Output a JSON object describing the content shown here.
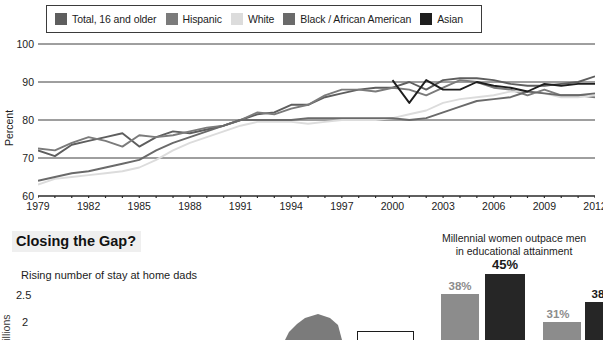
{
  "legend": {
    "items": [
      {
        "label": "Total, 16 and older",
        "color": "#5e5e5e"
      },
      {
        "label": "Hispanic",
        "color": "#7b7b7b"
      },
      {
        "label": "White",
        "color": "#dcdcdc"
      },
      {
        "label": "Black / African American",
        "color": "#6a6a6a"
      },
      {
        "label": "Asian",
        "color": "#1e1e1e"
      }
    ]
  },
  "chart_data": [
    {
      "type": "line",
      "title": "",
      "xlabel": "",
      "ylabel": "Percent",
      "ylim": [
        60,
        100
      ],
      "yticks": [
        60,
        70,
        80,
        90,
        100
      ],
      "xlim": [
        1979,
        2012
      ],
      "xticks_labeled": [
        1979,
        1982,
        1985,
        1988,
        1991,
        1994,
        1997,
        2000,
        2003,
        2006,
        2009,
        2012
      ],
      "grid": true,
      "legend_position": "top",
      "x": [
        1979,
        1980,
        1981,
        1982,
        1983,
        1984,
        1985,
        1986,
        1987,
        1988,
        1989,
        1990,
        1991,
        1992,
        1993,
        1994,
        1995,
        1996,
        1997,
        1998,
        1999,
        2000,
        2001,
        2002,
        2003,
        2004,
        2005,
        2006,
        2007,
        2008,
        2009,
        2010,
        2011,
        2012
      ],
      "series": [
        {
          "name": "Total, 16 and older",
          "color": "#5e5e5e",
          "values": [
            72.0,
            70.5,
            73.5,
            74.5,
            75.5,
            76.5,
            73.0,
            75.5,
            77.0,
            76.5,
            77.5,
            78.5,
            80.0,
            81.5,
            82.0,
            84.0,
            84.0,
            86.0,
            87.0,
            88.0,
            88.5,
            88.5,
            90.0,
            88.0,
            90.5,
            91.0,
            91.0,
            90.5,
            89.5,
            89.0,
            89.0,
            89.5,
            90.0,
            91.5
          ]
        },
        {
          "name": "Hispanic",
          "color": "#7b7b7b",
          "values": [
            72.5,
            72.0,
            74.0,
            75.5,
            74.5,
            73.0,
            76.0,
            75.5,
            76.0,
            77.0,
            78.0,
            78.5,
            80.0,
            82.0,
            81.5,
            83.0,
            84.0,
            86.5,
            88.0,
            88.0,
            87.5,
            88.5,
            88.0,
            86.5,
            88.5,
            90.5,
            90.0,
            88.5,
            88.0,
            86.5,
            88.0,
            86.5,
            86.5,
            86.0
          ]
        },
        {
          "name": "White",
          "color": "#dcdcdc",
          "values": [
            63.0,
            64.5,
            65.0,
            65.5,
            66.0,
            66.5,
            67.5,
            69.5,
            72.0,
            74.0,
            75.5,
            77.0,
            78.5,
            79.5,
            79.5,
            79.5,
            79.0,
            79.5,
            80.0,
            80.0,
            80.0,
            80.5,
            81.5,
            82.5,
            84.5,
            85.5,
            86.0,
            86.5,
            87.5,
            87.5,
            87.0,
            86.0,
            86.0,
            86.5
          ]
        },
        {
          "name": "Black / African American",
          "color": "#6a6a6a",
          "values": [
            64.0,
            65.0,
            66.0,
            66.5,
            67.5,
            68.5,
            69.5,
            72.0,
            74.0,
            75.5,
            77.0,
            78.5,
            80.0,
            80.0,
            80.0,
            80.0,
            80.5,
            80.5,
            80.5,
            80.5,
            80.5,
            80.5,
            80.0,
            80.5,
            82.0,
            83.5,
            85.0,
            85.5,
            86.0,
            87.5,
            87.0,
            86.5,
            86.5,
            87.0
          ]
        },
        {
          "name": "Asian",
          "color": "#1e1e1e",
          "values": [
            null,
            null,
            null,
            null,
            null,
            null,
            null,
            null,
            null,
            null,
            null,
            null,
            null,
            null,
            null,
            null,
            null,
            null,
            null,
            null,
            null,
            90.5,
            84.5,
            90.5,
            88.0,
            88.0,
            90.0,
            89.0,
            88.5,
            87.5,
            89.5,
            89.0,
            89.5,
            89.5
          ]
        }
      ]
    },
    {
      "type": "area",
      "title": "Rising number of stay at home dads",
      "ylabel": "Millions",
      "yticks": [
        "2.5",
        "2"
      ],
      "series_name": "Stay at home dads",
      "color": "#7b7b7b"
    },
    {
      "type": "bar",
      "title": "Millennial women outpace men\nin educational attainment",
      "categories": [
        "Women",
        "Men",
        "Women",
        "Men"
      ],
      "values": [
        38,
        45,
        31,
        38
      ],
      "labels": [
        "38%",
        "45%",
        "31%",
        "38%"
      ],
      "colors": [
        "#8c8c8c",
        "#262626",
        "#8c8c8c",
        "#262626"
      ],
      "ylim": [
        0,
        50
      ]
    }
  ],
  "lower": {
    "heading": "Closing the Gap?",
    "sahd_title": "Rising number of stay at home dads",
    "sahd_yticks": [
      "2.5",
      "2"
    ],
    "sahd_ylabel": "Millions",
    "millennial_title_line1": "Millennial women outpace men",
    "millennial_title_line2": "in educational attainment"
  }
}
